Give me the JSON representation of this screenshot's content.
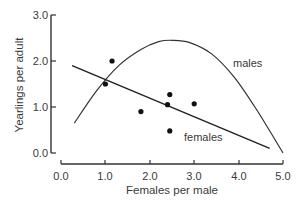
{
  "chart_data": {
    "type": "scatter",
    "title": "",
    "xlabel": "Females per male",
    "ylabel": "Yearlings per adult",
    "xlim": [
      0.0,
      5.0
    ],
    "ylim": [
      0.0,
      3.0
    ],
    "grid": false,
    "legend": "none (inline curve labels)",
    "xticks": [
      "0.0",
      "1.0",
      "2.0",
      "3.0",
      "4.0",
      "5.0"
    ],
    "yticks": [
      "0.0",
      "1.0",
      "2.0",
      "3.0"
    ],
    "points": [
      {
        "x": 1.15,
        "y": 2.0
      },
      {
        "x": 1.0,
        "y": 1.5
      },
      {
        "x": 1.8,
        "y": 0.9
      },
      {
        "x": 2.45,
        "y": 1.27
      },
      {
        "x": 2.4,
        "y": 1.05
      },
      {
        "x": 3.0,
        "y": 1.07
      },
      {
        "x": 2.45,
        "y": 0.48
      }
    ],
    "series": [
      {
        "name": "females",
        "type": "line",
        "label": "females",
        "x": [
          0.25,
          4.7
        ],
        "y": [
          1.9,
          0.1
        ]
      },
      {
        "name": "males",
        "type": "curve",
        "label": "males",
        "x": [
          0.3,
          0.8,
          1.3,
          1.8,
          2.2,
          2.5,
          2.9,
          3.4,
          3.9,
          4.4,
          5.0
        ],
        "y": [
          0.65,
          1.35,
          1.9,
          2.25,
          2.42,
          2.45,
          2.4,
          2.15,
          1.65,
          0.95,
          0.0
        ]
      }
    ]
  },
  "axes": {
    "x_title": "Females per male",
    "y_title": "Yearlings per adult",
    "x_ticks": [
      "0.0",
      "1.0",
      "2.0",
      "3.0",
      "4.0",
      "5.0"
    ],
    "y_ticks": [
      "0.0",
      "1.0",
      "2.0",
      "3.0"
    ]
  },
  "labels": {
    "males": "males",
    "females": "females"
  }
}
